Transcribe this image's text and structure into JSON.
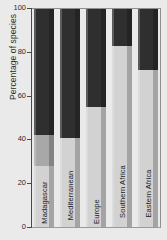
{
  "chart_data": {
    "type": "bar",
    "subtype": "stacked-bar-100",
    "title": "",
    "xlabel": "",
    "ylabel": "Percentage of species",
    "ylim": [
      0,
      100
    ],
    "yticks": [
      0,
      20,
      40,
      60,
      80,
      100
    ],
    "ytick_labels": [
      "0",
      "20",
      "40",
      "60",
      "80",
      "100"
    ],
    "grid": false,
    "legend": "none",
    "categories": [
      "Madagascar",
      "Mediterranean",
      "Europe",
      "Southern Africa",
      "Eastern Africa"
    ],
    "series": [
      {
        "name": "lower-segment",
        "color": "#d2d2d2",
        "values": [
          28,
          41,
          55,
          83,
          72
        ]
      },
      {
        "name": "middle-segment",
        "color": "#a8a8a8",
        "values": [
          14,
          0,
          0,
          0,
          0
        ]
      },
      {
        "name": "upper-segment",
        "color": "#2f2f2f",
        "values": [
          58,
          59,
          45,
          17,
          28
        ]
      }
    ],
    "stack_tops": {
      "Madagascar": [
        28,
        42,
        100
      ],
      "Mediterranean": [
        41,
        41,
        100
      ],
      "Europe": [
        55,
        55,
        100
      ],
      "Southern Africa": [
        83,
        83,
        100
      ],
      "Eastern Africa": [
        72,
        72,
        100
      ]
    },
    "colors": {
      "light": "#d2d2d2",
      "medium": "#a8a8a8",
      "dark": "#2f2f2f",
      "background": "#eaeaea",
      "axis": "#4a4a4a",
      "text": "#1c1c1c"
    }
  }
}
